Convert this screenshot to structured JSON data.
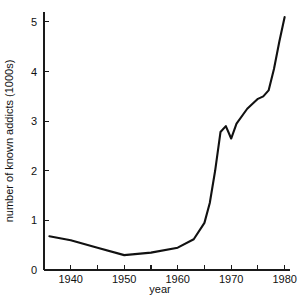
{
  "chart_data": {
    "type": "line",
    "title": "",
    "xlabel": "year",
    "ylabel": "number of known addicts (1000s)",
    "xlim": [
      1935,
      1981
    ],
    "ylim": [
      0,
      5.2
    ],
    "grid": false,
    "legend": "none",
    "x_major_ticks": [
      1940,
      1950,
      1960,
      1970,
      1980
    ],
    "x_minor_ticks": [
      1935,
      1945,
      1955,
      1965,
      1975
    ],
    "x_tick_labels": [
      "1940",
      "1950",
      "1960",
      "1970",
      "1980"
    ],
    "y_ticks": [
      0,
      1,
      2,
      3,
      4,
      5
    ],
    "y_tick_labels": [
      "0",
      "1",
      "2",
      "3",
      "4",
      "5"
    ],
    "series": [
      {
        "name": "known addicts",
        "color": "#111111",
        "x": [
          1936,
          1940,
          1945,
          1950,
          1955,
          1960,
          1963,
          1965,
          1966,
          1967,
          1968,
          1969,
          1970,
          1971,
          1973,
          1975,
          1976,
          1977,
          1978,
          1979,
          1980
        ],
        "values": [
          0.68,
          0.6,
          0.45,
          0.3,
          0.35,
          0.45,
          0.62,
          0.95,
          1.35,
          2.0,
          2.78,
          2.9,
          2.65,
          2.95,
          3.25,
          3.45,
          3.5,
          3.62,
          4.05,
          4.6,
          5.1
        ]
      }
    ]
  },
  "axis_labels": {
    "x_title": "year",
    "y_title": "number of known addicts (1000s)"
  }
}
